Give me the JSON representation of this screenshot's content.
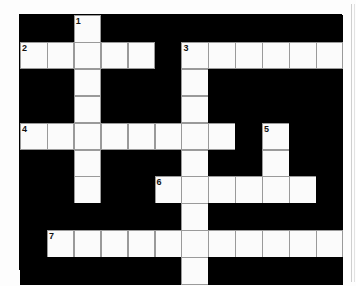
{
  "puzzle": {
    "title": "Crossword Puzzle Grid",
    "type": "crossword",
    "columns": 12,
    "rows": 10,
    "cell_size": 26.9,
    "origin_x": 19,
    "origin_y": 14,
    "colors": {
      "block": "#000000",
      "cell": "#fbfbfb",
      "cell_border": "#9a9a9a",
      "number": "#111111",
      "page": "#ffffff",
      "page_edge_rule": "#cfcfcf"
    },
    "white_cells": [
      [
        0,
        2
      ],
      [
        1,
        0
      ],
      [
        1,
        1
      ],
      [
        1,
        2
      ],
      [
        1,
        3
      ],
      [
        1,
        4
      ],
      [
        1,
        6
      ],
      [
        1,
        7
      ],
      [
        1,
        8
      ],
      [
        1,
        9
      ],
      [
        1,
        10
      ],
      [
        1,
        11
      ],
      [
        2,
        2
      ],
      [
        2,
        6
      ],
      [
        3,
        2
      ],
      [
        3,
        6
      ],
      [
        4,
        0
      ],
      [
        4,
        1
      ],
      [
        4,
        2
      ],
      [
        4,
        3
      ],
      [
        4,
        4
      ],
      [
        4,
        5
      ],
      [
        4,
        6
      ],
      [
        4,
        7
      ],
      [
        4,
        9
      ],
      [
        5,
        2
      ],
      [
        5,
        6
      ],
      [
        5,
        9
      ],
      [
        6,
        2
      ],
      [
        6,
        5
      ],
      [
        6,
        6
      ],
      [
        6,
        7
      ],
      [
        6,
        8
      ],
      [
        6,
        9
      ],
      [
        6,
        10
      ],
      [
        7,
        6
      ],
      [
        8,
        1
      ],
      [
        8,
        2
      ],
      [
        8,
        3
      ],
      [
        8,
        4
      ],
      [
        8,
        5
      ],
      [
        8,
        6
      ],
      [
        8,
        7
      ],
      [
        8,
        8
      ],
      [
        8,
        9
      ],
      [
        8,
        10
      ],
      [
        8,
        11
      ],
      [
        9,
        6
      ]
    ],
    "numbered_cells": [
      {
        "number": "1",
        "row": 0,
        "col": 2,
        "direction": "down",
        "length": 7
      },
      {
        "number": "2",
        "row": 1,
        "col": 0,
        "direction": "across",
        "length": 5
      },
      {
        "number": "3",
        "row": 1,
        "col": 6,
        "direction": "across",
        "length": 6
      },
      {
        "number": "4",
        "row": 4,
        "col": 0,
        "direction": "across",
        "length": 8
      },
      {
        "number": "5",
        "row": 4,
        "col": 9,
        "direction": "down",
        "length": 3
      },
      {
        "number": "6",
        "row": 6,
        "col": 5,
        "direction": "across",
        "length": 6
      },
      {
        "number": "7",
        "row": 8,
        "col": 1,
        "direction": "across",
        "length": 11
      }
    ]
  }
}
